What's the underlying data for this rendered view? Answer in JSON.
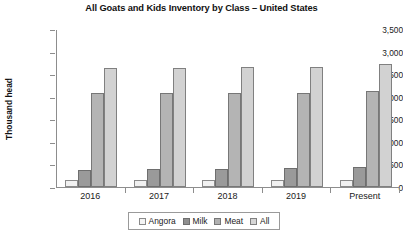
{
  "chart_data": {
    "type": "bar",
    "title": "All Goats and Kids Inventory by Class – United States",
    "xlabel": "",
    "ylabel": "Thousand head",
    "categories": [
      "2016",
      "2017",
      "2018",
      "2019",
      "Present"
    ],
    "ylim": [
      0,
      3500
    ],
    "ytick_labels": [
      "3,500",
      "3,000",
      "2,500",
      "2,000",
      "1,500",
      "1,000",
      "500",
      "0"
    ],
    "ytick_values": [
      3500,
      3000,
      2500,
      2000,
      1500,
      1000,
      500,
      0
    ],
    "grid": false,
    "legend_position": "bottom",
    "series": [
      {
        "name": "Angora",
        "color": "#f1f1f1",
        "values": [
          150,
          145,
          150,
          145,
          145
        ]
      },
      {
        "name": "Milk",
        "color": "#9a9a9a",
        "values": [
          380,
          390,
          400,
          430,
          450
        ]
      },
      {
        "name": "Meat",
        "color": "#b4b4b4",
        "values": [
          2080,
          2090,
          2090,
          2080,
          2120
        ]
      },
      {
        "name": "All",
        "color": "#d2d2d2",
        "values": [
          2630,
          2640,
          2650,
          2650,
          2720
        ]
      }
    ]
  },
  "legend": {
    "items": [
      {
        "label": "Angora",
        "swatch": "legend-swatch-angora"
      },
      {
        "label": "Milk",
        "swatch": "legend-swatch-milk"
      },
      {
        "label": "Meat",
        "swatch": "legend-swatch-meat"
      },
      {
        "label": "All",
        "swatch": "legend-swatch-all"
      }
    ]
  }
}
